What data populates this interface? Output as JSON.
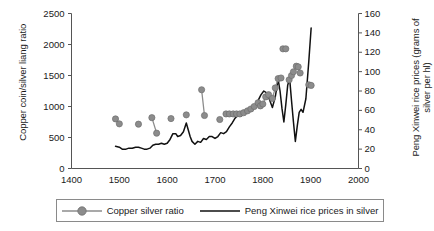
{
  "chart_data": {
    "type": "line",
    "title": "",
    "xlabel": "",
    "xlim": [
      1400,
      2000
    ],
    "xticks": [
      1400,
      1500,
      1600,
      1700,
      1800,
      1900,
      2000
    ],
    "grid": false,
    "legend_position": "bottom",
    "axes": {
      "left": {
        "label": "Copper coin/silver liang ratio",
        "ticks": [
          0,
          500,
          1000,
          1500,
          2000,
          2500
        ],
        "ylim": [
          0,
          2500
        ]
      },
      "right": {
        "label": "Peng Xinwei rice prices (grams of silver per hl)",
        "ticks": [
          0,
          20,
          40,
          60,
          80,
          100,
          120,
          140,
          160
        ],
        "ylim": [
          0,
          160
        ]
      }
    },
    "series": [
      {
        "name": "Copper silver ratio",
        "axis": "left",
        "style": "line-markers",
        "color": "#8c8c8c",
        "marker_color": "#8c8c8c",
        "segments": [
          [
            [
              1492,
              800
            ],
            [
              1500,
              720
            ]
          ],
          [
            [
              1540,
              715
            ]
          ],
          [
            [
              1568,
              820
            ],
            [
              1578,
              570
            ]
          ],
          [
            [
              1608,
              805
            ]
          ],
          [
            [
              1640,
              865
            ]
          ],
          [
            [
              1672,
              1270
            ],
            [
              1678,
              855
            ]
          ],
          [
            [
              1710,
              790
            ]
          ],
          [
            [
              1723,
              880
            ],
            [
              1730,
              880
            ],
            [
              1738,
              880
            ],
            [
              1745,
              880
            ],
            [
              1752,
              880
            ],
            [
              1760,
              900
            ],
            [
              1768,
              930
            ],
            [
              1775,
              960
            ],
            [
              1782,
              1000
            ],
            [
              1790,
              1060
            ],
            [
              1795,
              1010
            ],
            [
              1800,
              1040
            ],
            [
              1806,
              1155
            ],
            [
              1812,
              1190
            ]
          ],
          [
            [
              1820,
              1130
            ],
            [
              1826,
              1300
            ],
            [
              1832,
              1450
            ],
            [
              1838,
              1460
            ]
          ],
          [
            [
              1842,
              1930
            ],
            [
              1848,
              1930
            ]
          ],
          [
            [
              1855,
              1430
            ],
            [
              1860,
              1500
            ],
            [
              1864,
              1560
            ]
          ],
          [
            [
              1870,
              1650
            ],
            [
              1874,
              1640
            ],
            [
              1878,
              1540
            ]
          ],
          [
            [
              1896,
              1350
            ],
            [
              1901,
              1340
            ]
          ]
        ]
      },
      {
        "name": "Peng Xinwei rice prices in silver",
        "axis": "right",
        "style": "line",
        "color": "#111111",
        "points": [
          [
            1492,
            23
          ],
          [
            1500,
            22
          ],
          [
            1506,
            20
          ],
          [
            1514,
            20
          ],
          [
            1520,
            21
          ],
          [
            1527,
            21
          ],
          [
            1534,
            22
          ],
          [
            1540,
            22
          ],
          [
            1546,
            21
          ],
          [
            1552,
            20
          ],
          [
            1558,
            20
          ],
          [
            1564,
            21
          ],
          [
            1570,
            24
          ],
          [
            1576,
            25
          ],
          [
            1582,
            25
          ],
          [
            1588,
            26
          ],
          [
            1594,
            25
          ],
          [
            1600,
            26
          ],
          [
            1606,
            30
          ],
          [
            1612,
            36
          ],
          [
            1618,
            36
          ],
          [
            1622,
            33
          ],
          [
            1628,
            34
          ],
          [
            1634,
            38
          ],
          [
            1640,
            47
          ],
          [
            1644,
            40
          ],
          [
            1648,
            33
          ],
          [
            1652,
            28
          ],
          [
            1658,
            25
          ],
          [
            1664,
            28
          ],
          [
            1670,
            27
          ],
          [
            1676,
            31
          ],
          [
            1682,
            30
          ],
          [
            1688,
            33
          ],
          [
            1694,
            33
          ],
          [
            1700,
            31
          ],
          [
            1706,
            33
          ],
          [
            1712,
            37
          ],
          [
            1718,
            36
          ],
          [
            1724,
            38
          ],
          [
            1730,
            43
          ],
          [
            1736,
            47
          ],
          [
            1742,
            52
          ],
          [
            1748,
            55
          ],
          [
            1754,
            54
          ],
          [
            1760,
            57
          ],
          [
            1766,
            58
          ],
          [
            1772,
            59
          ],
          [
            1778,
            61
          ],
          [
            1784,
            64
          ],
          [
            1790,
            70
          ],
          [
            1796,
            76
          ],
          [
            1802,
            80
          ],
          [
            1808,
            78
          ],
          [
            1814,
            71
          ],
          [
            1820,
            63
          ],
          [
            1826,
            74
          ],
          [
            1832,
            92
          ],
          [
            1836,
            80
          ],
          [
            1840,
            62
          ],
          [
            1844,
            48
          ],
          [
            1848,
            66
          ],
          [
            1852,
            86
          ],
          [
            1856,
            93
          ],
          [
            1860,
            70
          ],
          [
            1864,
            48
          ],
          [
            1868,
            28
          ],
          [
            1872,
            44
          ],
          [
            1876,
            58
          ],
          [
            1880,
            61
          ],
          [
            1884,
            58
          ],
          [
            1890,
            72
          ],
          [
            1896,
            110
          ],
          [
            1901,
            145
          ]
        ]
      }
    ]
  },
  "legend": {
    "items": [
      {
        "label": "Copper silver ratio",
        "marker": "circle-marker",
        "color": "#8c8c8c"
      },
      {
        "label": "Peng Xinwei rice prices in silver",
        "marker": "line-swatch",
        "color": "#111111"
      }
    ]
  }
}
